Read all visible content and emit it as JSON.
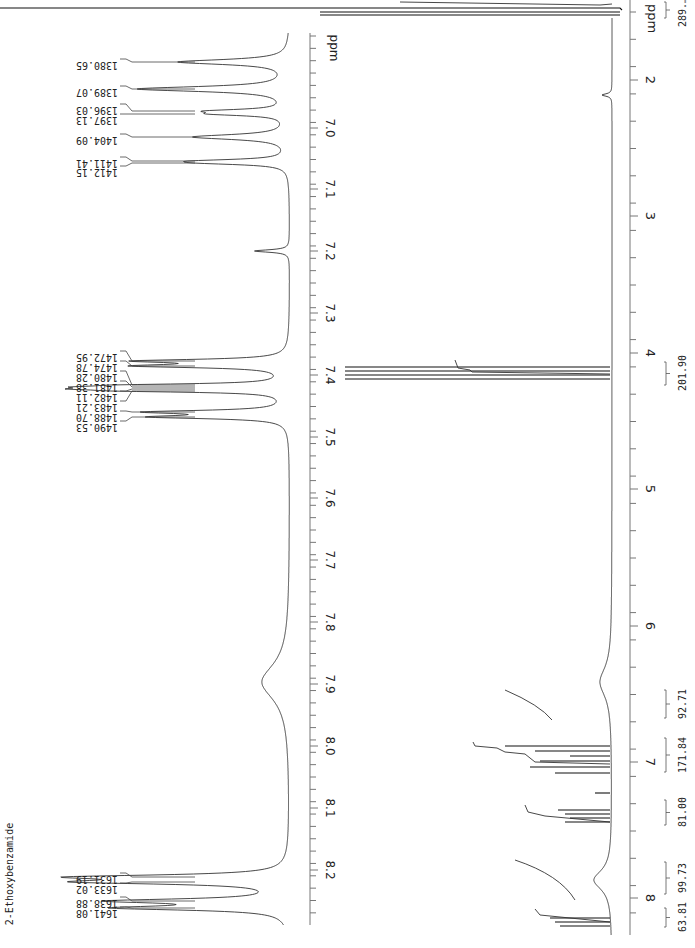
{
  "title": "2-Ethoxybenzamide",
  "chart_data": [
    {
      "type": "line",
      "title": "2-Ethoxybenzamide 1H NMR (expansion, aromatic region)",
      "orientation": "rotated 90° (ppm axis vertical, increasing downward)",
      "xlabel": "ppm",
      "axis_range_ppm": [
        6.93,
        8.22
      ],
      "tick_labels": [
        "ppm",
        "7.0",
        "7.1",
        "7.2",
        "7.3",
        "7.4",
        "7.5",
        "7.6",
        "7.7",
        "7.8",
        "7.9",
        "8.0",
        "8.1",
        "8.2"
      ],
      "grid": false,
      "peak_labels_hz": [
        "1380.65",
        "1389.07",
        "1396.03",
        "1397.13",
        "1404.09",
        "1411.41",
        "1412.15",
        "1472.95",
        "1474.78",
        "1480.28",
        "1481.38",
        "1482.11",
        "1483.21",
        "1488.70",
        "1490.53",
        "1631.19",
        "1633.02",
        "1638.88",
        "1641.08"
      ],
      "peaks": [
        {
          "ppm": 6.96,
          "rel_height": 0.65
        },
        {
          "ppm": 6.99,
          "rel_height": 0.8
        },
        {
          "ppm": 7.015,
          "rel_height": 0.35
        },
        {
          "ppm": 7.03,
          "rel_height": 0.3
        },
        {
          "ppm": 7.05,
          "rel_height": 0.6
        },
        {
          "ppm": 7.075,
          "rel_height": 0.45
        },
        {
          "ppm": 7.08,
          "rel_height": 0.4
        },
        {
          "ppm": 7.26,
          "rel_height": 0.12
        },
        {
          "ppm": 7.365,
          "rel_height": 0.6
        },
        {
          "ppm": 7.37,
          "rel_height": 0.6
        },
        {
          "ppm": 7.4,
          "rel_height": 0.55
        },
        {
          "ppm": 7.405,
          "rel_height": 0.6
        },
        {
          "ppm": 7.41,
          "rel_height": 0.62
        },
        {
          "ppm": 7.415,
          "rel_height": 0.55
        },
        {
          "ppm": 7.445,
          "rel_height": 0.45
        },
        {
          "ppm": 7.45,
          "rel_height": 0.5
        },
        {
          "ppm": 7.88,
          "rel_height": 0.28,
          "broad": true
        },
        {
          "ppm": 8.16,
          "rel_height": 0.85
        },
        {
          "ppm": 8.17,
          "rel_height": 0.9
        },
        {
          "ppm": 8.195,
          "rel_height": 0.75
        },
        {
          "ppm": 8.205,
          "rel_height": 0.7
        }
      ]
    },
    {
      "type": "line",
      "title": "2-Ethoxybenzamide 1H NMR (full spectrum)",
      "orientation": "rotated 90° (ppm axis vertical, increasing downward)",
      "xlabel": "ppm",
      "axis_range_ppm": [
        1.5,
        8.2
      ],
      "tick_labels": [
        "ppm",
        "2",
        "3",
        "4",
        "5",
        "6",
        "7",
        "8"
      ],
      "grid": false,
      "integrals": [
        {
          "label": "289.…",
          "ppm_range": [
            1.3,
            1.5
          ]
        },
        {
          "label": "201.90",
          "ppm_range": [
            4.05,
            4.15
          ]
        },
        {
          "label": "92.71",
          "ppm_range": [
            6.8,
            6.95
          ]
        },
        {
          "label": "171.84",
          "ppm_range": [
            6.98,
            7.12
          ]
        },
        {
          "label": "81.00",
          "ppm_range": [
            7.35,
            7.45
          ]
        },
        {
          "label": "99.73",
          "ppm_range": [
            7.85,
            8.0
          ]
        },
        {
          "label": "63.81",
          "ppm_range": [
            8.15,
            8.22
          ]
        }
      ],
      "peaks": [
        {
          "ppm": 1.45,
          "rel_height": 1.0,
          "note": "CH3 triplet (off-scale)"
        },
        {
          "ppm": 2.15,
          "rel_height": 0.05
        },
        {
          "ppm": 4.12,
          "rel_height": 0.85,
          "note": "OCH2 quartet"
        },
        {
          "ppm": 6.85,
          "rel_height": 0.15,
          "broad": true
        },
        {
          "ppm": 7.05,
          "rel_height": 0.55
        },
        {
          "ppm": 7.4,
          "rel_height": 0.4
        },
        {
          "ppm": 7.88,
          "rel_height": 0.08,
          "broad": true
        },
        {
          "ppm": 8.18,
          "rel_height": 0.45
        }
      ]
    }
  ],
  "labels": {
    "compound": "2-Ethoxybenzamide",
    "left_axis_unit": "ppm",
    "right_axis_unit": "ppm",
    "left_ticks": [
      {
        "text": "7.0",
        "y": 128
      },
      {
        "text": "7.1",
        "y": 189
      },
      {
        "text": "7.2",
        "y": 251
      },
      {
        "text": "7.3",
        "y": 313
      },
      {
        "text": "7.4",
        "y": 375
      },
      {
        "text": "7.5",
        "y": 437
      },
      {
        "text": "7.6",
        "y": 498
      },
      {
        "text": "7.7",
        "y": 560
      },
      {
        "text": "7.8",
        "y": 622
      },
      {
        "text": "7.9",
        "y": 684
      },
      {
        "text": "8.0",
        "y": 746
      },
      {
        "text": "8.1",
        "y": 808
      },
      {
        "text": "8.2",
        "y": 870
      }
    ],
    "right_ticks": [
      {
        "text": "2",
        "y": 80
      },
      {
        "text": "3",
        "y": 216
      },
      {
        "text": "4",
        "y": 353
      },
      {
        "text": "5",
        "y": 489
      },
      {
        "text": "6",
        "y": 626
      },
      {
        "text": "7",
        "y": 762
      },
      {
        "text": "8",
        "y": 898
      }
    ],
    "peak_label_groups": [
      {
        "labels": [
          "1380.65"
        ],
        "label_y": [
          62
        ],
        "peak_y": [
          62
        ]
      },
      {
        "labels": [
          "1389.07"
        ],
        "label_y": [
          89
        ],
        "peak_y": [
          89
        ]
      },
      {
        "labels": [
          "1396.03",
          "1397.13"
        ],
        "label_y": [
          107,
          117
        ],
        "peak_y": [
          111,
          114
        ]
      },
      {
        "labels": [
          "1404.09"
        ],
        "label_y": [
          137
        ],
        "peak_y": [
          137
        ]
      },
      {
        "labels": [
          "1411.41",
          "1412.15"
        ],
        "label_y": [
          160,
          169
        ],
        "peak_y": [
          161,
          163
        ]
      },
      {
        "labels": [
          "1472.95",
          "1474.78",
          "1480.28",
          "1481.38",
          "1482.11",
          "1483.21",
          "1488.70",
          "1490.53"
        ],
        "label_y": [
          354,
          364,
          374,
          384,
          394,
          404,
          414,
          424
        ],
        "peak_y": [
          361,
          366,
          385,
          387,
          389,
          391,
          412,
          417
        ]
      },
      {
        "labels": [
          "1631.19",
          "1633.02"
        ],
        "label_y": [
          876,
          886
        ],
        "peak_y": [
          877,
          882
        ]
      },
      {
        "labels": [
          "1638.88",
          "1641.08"
        ],
        "label_y": [
          900,
          910
        ],
        "peak_y": [
          901,
          908
        ]
      }
    ],
    "integrals": [
      {
        "text": "289.…",
        "y1": 2,
        "y2": 18,
        "text_y": 12
      },
      {
        "text": "201.90",
        "y1": 362,
        "y2": 385,
        "text_y": 373
      },
      {
        "text": "92.71",
        "y1": 690,
        "y2": 718,
        "text_y": 704
      },
      {
        "text": "171.84",
        "y1": 738,
        "y2": 772,
        "text_y": 755
      },
      {
        "text": "81.00",
        "y1": 800,
        "y2": 825,
        "text_y": 812
      },
      {
        "text": "99.73",
        "y1": 862,
        "y2": 894,
        "text_y": 878
      },
      {
        "text": "63.81",
        "y1": 908,
        "y2": 927,
        "text_y": 917
      }
    ]
  }
}
